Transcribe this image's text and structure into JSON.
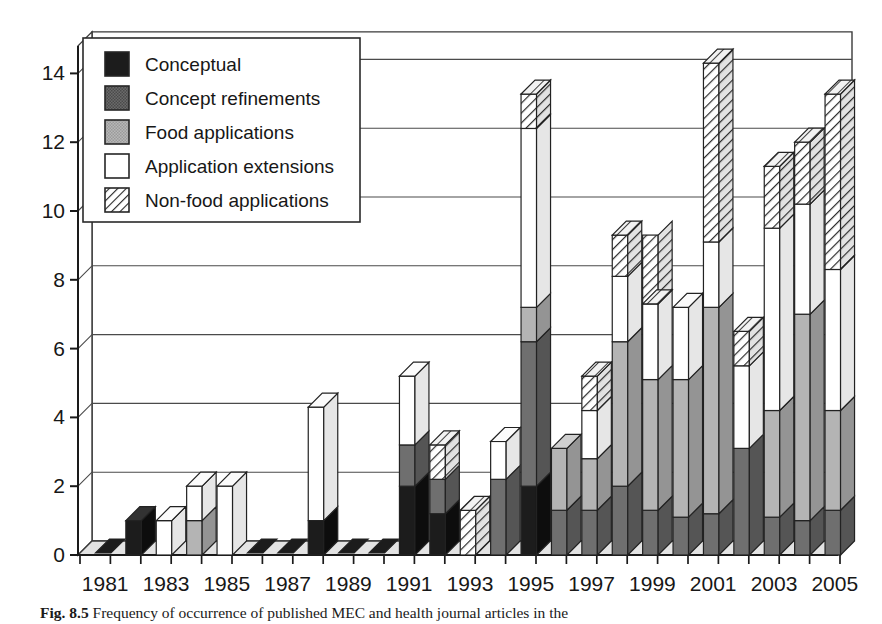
{
  "figure": {
    "caption_label": "Fig. 8.5",
    "caption_text": "Frequency of occurrence of published MEC and health journal articles in the"
  },
  "legend": {
    "items": [
      {
        "key": "conceptual",
        "label": "Conceptual",
        "swatch": "solid-dark",
        "color": "#1c1c1c"
      },
      {
        "key": "concept_refinements",
        "label": "Concept refinements",
        "swatch": "solid-mid",
        "color": "#5f5f5f"
      },
      {
        "key": "food_applications",
        "label": "Food applications",
        "swatch": "solid-light",
        "color": "#a8a8a8"
      },
      {
        "key": "application_extensions",
        "label": "Application extensions",
        "swatch": "solid-white",
        "color": "#ffffff"
      },
      {
        "key": "non_food_applications",
        "label": "Non-food applications",
        "swatch": "hatched",
        "color": "#ffffff"
      }
    ]
  },
  "axes": {
    "y_ticks": [
      "0",
      "2",
      "4",
      "6",
      "8",
      "10",
      "12",
      "14"
    ],
    "y_min": 0,
    "y_max": 14.8,
    "x_tick_labels": [
      "1981",
      "1983",
      "1985",
      "1987",
      "1989",
      "1991",
      "1993",
      "1995",
      "1997",
      "1999",
      "2001",
      "2003",
      "2005"
    ]
  },
  "chart_data": {
    "type": "bar",
    "subtype": "stacked-3d-column",
    "title": "",
    "xlabel": "",
    "ylabel": "",
    "ylim": [
      0,
      14.8
    ],
    "grid": true,
    "legend_position": "upper-left-inside",
    "categories": [
      "1981",
      "1982",
      "1983",
      "1984",
      "1985",
      "1986",
      "1987",
      "1988",
      "1989",
      "1990",
      "1991",
      "1992",
      "1993",
      "1994",
      "1995",
      "1996",
      "1997",
      "1998",
      "1999",
      "2000",
      "2001",
      "2002",
      "2003",
      "2004",
      "2005"
    ],
    "series": [
      {
        "name": "Conceptual",
        "values": [
          0,
          1.0,
          0,
          0,
          0,
          0,
          0,
          1.0,
          0,
          0,
          2.0,
          1.2,
          0,
          0,
          2.0,
          0,
          0,
          0,
          0,
          0,
          0,
          0,
          0,
          0,
          0
        ]
      },
      {
        "name": "Concept refinements",
        "values": [
          0,
          0,
          0,
          0,
          0,
          0,
          0,
          0,
          0,
          0,
          1.2,
          1.0,
          0,
          2.2,
          4.2,
          1.3,
          1.3,
          2.0,
          1.3,
          1.1,
          1.2,
          3.1,
          1.1,
          1.0,
          1.3
        ]
      },
      {
        "name": "Food applications",
        "values": [
          0,
          0,
          0,
          1.0,
          0,
          0,
          0,
          0,
          0,
          0,
          0,
          0,
          0,
          0,
          1.0,
          1.8,
          1.5,
          4.2,
          3.8,
          4.0,
          6.0,
          0,
          3.1,
          6.0,
          2.9
        ]
      },
      {
        "name": "Application extensions",
        "values": [
          0,
          0,
          1.0,
          1.0,
          2.0,
          0,
          0,
          3.3,
          0,
          0,
          2.0,
          0,
          0,
          1.1,
          5.2,
          0,
          1.4,
          1.9,
          2.2,
          2.1,
          1.9,
          2.4,
          5.3,
          3.2,
          4.1
        ]
      },
      {
        "name": "Non-food applications",
        "values": [
          0,
          0,
          0,
          0,
          0,
          0,
          0,
          0,
          0,
          0,
          0,
          1.0,
          1.3,
          0,
          1.0,
          0,
          1.0,
          1.2,
          2.0,
          0,
          5.2,
          1.0,
          1.8,
          1.8,
          5.1
        ]
      }
    ],
    "totals": [
      0,
      1.0,
      1.0,
      2.0,
      2.0,
      0,
      0,
      4.3,
      0,
      0,
      5.2,
      3.2,
      1.3,
      3.3,
      13.4,
      3.1,
      5.2,
      9.3,
      7.3,
      7.2,
      14.3,
      6.5,
      11.3,
      12.0,
      13.4
    ]
  }
}
